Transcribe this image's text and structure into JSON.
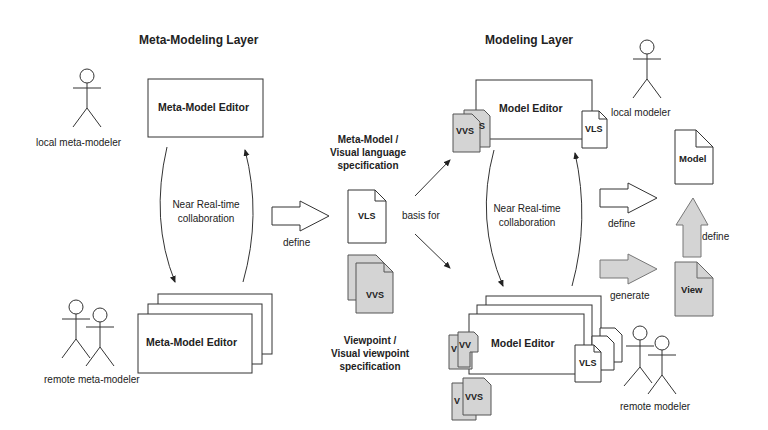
{
  "meta_layer": {
    "title": "Meta-Modeling Layer",
    "editor_top": "Meta-Model Editor",
    "editor_bottom": "Meta-Model Editor",
    "local_actor": "local meta-modeler",
    "remote_actor": "remote meta-modeler",
    "collab_line1": "Near Real-time",
    "collab_line2": "collaboration"
  },
  "middle": {
    "define_label": "define",
    "vls_title_line1": "Meta-Model /",
    "vls_title_line2": "Visual language",
    "vls_title_line3": "specification",
    "vls_doc": "VLS",
    "vvs_doc": "VVS",
    "vvs_title_line1": "Viewpoint /",
    "vvs_title_line2": "Visual viewpoint",
    "vvs_title_line3": "specification",
    "basis_label": "basis for"
  },
  "model_layer": {
    "title": "Modeling Layer",
    "editor_top": "Model Editor",
    "editor_bottom": "Model Editor",
    "local_actor": "local modeler",
    "remote_actor": "remote modeler",
    "collab_line1": "Near Real-time",
    "collab_line2": "collaboration",
    "vls_doc": "VLS",
    "vvs_doc": "VVS",
    "vvs_back_frag": "S",
    "vvs_back_frag_v": "V",
    "vvs_back_frag_vv": "VV"
  },
  "outputs": {
    "define_label": "define",
    "generate_label": "generate",
    "define_up_label": "define",
    "model_doc": "Model",
    "view_doc": "View"
  },
  "colors": {
    "line": "#333333",
    "grey_fill": "#d4d4d4",
    "white_fill": "#ffffff"
  }
}
